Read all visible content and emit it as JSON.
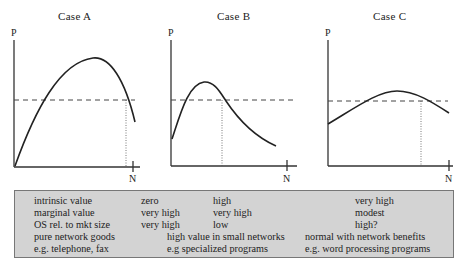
{
  "cases": [
    {
      "title": "Case  A",
      "y_label": "P",
      "x_label": "N"
    },
    {
      "title": "Case  B",
      "y_label": "P",
      "x_label": "N"
    },
    {
      "title": "Case  C",
      "y_label": "P",
      "x_label": "N"
    }
  ],
  "table": {
    "rows": [
      {
        "label": "intrinsic value",
        "a": "zero",
        "b": "high",
        "c": "very high"
      },
      {
        "label": "marginal value",
        "a": "very high",
        "b": "very high",
        "c": "modest"
      },
      {
        "label": "OS rel. to mkt size",
        "a": "very high",
        "b": "low",
        "c": "high?"
      },
      {
        "label": "pure network goods",
        "a": "",
        "b": "high value in small networks",
        "c": "normal with network benefits"
      },
      {
        "label": "e.g. telephone, fax",
        "a": "",
        "b": "e.g specialized programs",
        "c": "e.g. word processing programs"
      }
    ]
  },
  "footer_text": "..."
}
